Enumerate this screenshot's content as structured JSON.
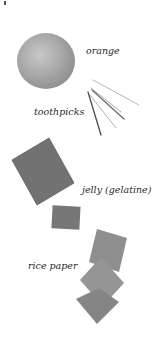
{
  "items": [
    {
      "label": "orange",
      "icon": "orange-icon"
    },
    {
      "label": "toothpicks",
      "icon": "toothpicks-icon"
    },
    {
      "label": "jelly (gelatine)",
      "icon": "jelly-icon"
    },
    {
      "label": "rice paper",
      "icon": "rice-paper-icon"
    }
  ],
  "colors": {
    "orange": "#9a9a9a",
    "jelly": "#6f6f6f",
    "rice_paper": "#8a8a8a",
    "toothpick": "#7a7a7a"
  }
}
